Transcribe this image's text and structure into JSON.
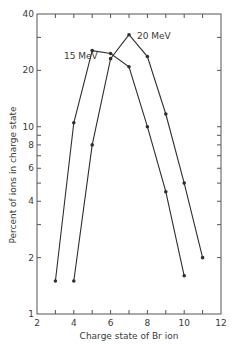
{
  "chart_data": {
    "type": "line",
    "title": "",
    "xlabel": "Charge state of Br ion",
    "ylabel": "Percent of ions in charge state",
    "xlim": [
      2,
      12
    ],
    "ylim": [
      1,
      40
    ],
    "yscale": "log",
    "xticks": [
      2,
      3,
      4,
      5,
      6,
      7,
      8,
      9,
      10,
      11,
      12
    ],
    "xtick_labels": [
      "2",
      "4",
      "6",
      "8",
      "10",
      "12"
    ],
    "xtick_label_values": [
      2,
      4,
      6,
      8,
      10,
      12
    ],
    "yticks": [
      2,
      3,
      4,
      5,
      6,
      7,
      8,
      9,
      10,
      20,
      30
    ],
    "ytick_labels": [
      "1",
      "2",
      "4",
      "6",
      "8",
      "10",
      "20",
      "40"
    ],
    "ytick_label_values": [
      1,
      2,
      4,
      6,
      8,
      10,
      20,
      40
    ],
    "grid": false,
    "line_color": "#2e2e2e",
    "series": [
      {
        "name": "15 MeV",
        "x": [
          3,
          4,
          5,
          6,
          7,
          8,
          9,
          10
        ],
        "y": [
          1.5,
          10.5,
          25.5,
          24.6,
          20.9,
          10.0,
          4.5,
          1.6
        ]
      },
      {
        "name": "20 MeV",
        "x": [
          4,
          5,
          6,
          7,
          8,
          9,
          10,
          11
        ],
        "y": [
          1.5,
          8.0,
          23.1,
          31.0,
          23.7,
          11.7,
          5.0,
          2.0
        ]
      }
    ],
    "annotations": [
      {
        "text": "15 MeV",
        "series": "15 MeV"
      },
      {
        "text": "20 MeV",
        "series": "20 MeV"
      }
    ]
  }
}
